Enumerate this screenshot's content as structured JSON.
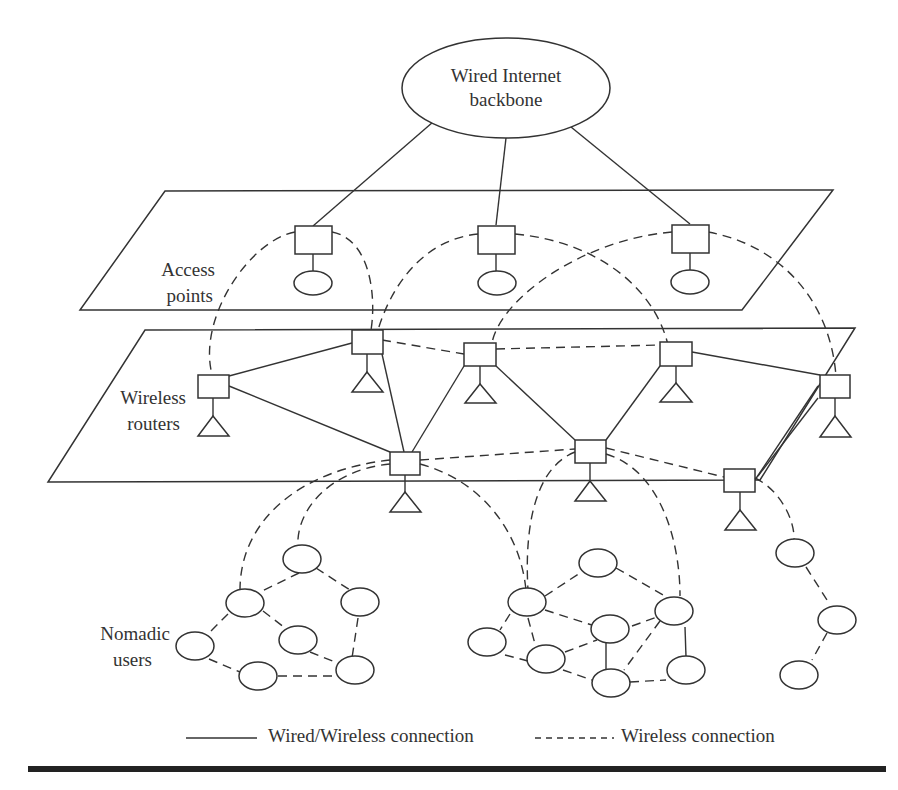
{
  "diagram": {
    "backbone": {
      "line1": "Wired Internet",
      "line2": "backbone"
    },
    "layers": {
      "access_points": {
        "line1": "Access",
        "line2": "points"
      },
      "wireless_routers": {
        "line1": "Wireless",
        "line2": "routers"
      },
      "nomadic_users": {
        "line1": "Nomadic",
        "line2": "users"
      }
    },
    "legend": {
      "solid_label": "Wired/Wireless connection",
      "dashed_label": "Wireless connection"
    },
    "colors": {
      "stroke": "#333333",
      "background": "#ffffff",
      "rule": "#222222"
    },
    "node_counts": {
      "access_points": 3,
      "wireless_routers": 8,
      "nomadic_users": 21
    }
  }
}
